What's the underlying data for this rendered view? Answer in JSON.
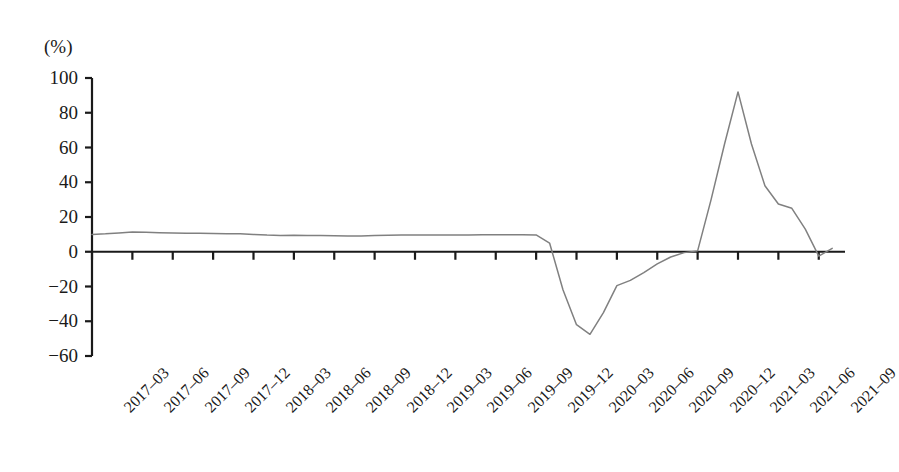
{
  "chart_data": {
    "type": "line",
    "title": "",
    "xlabel": "",
    "ylabel": "",
    "unit_label": "(%)",
    "ylim": [
      -60,
      100
    ],
    "ytick_values": [
      100,
      80,
      60,
      40,
      20,
      0,
      -20,
      -40,
      -60
    ],
    "ytick_labels": [
      "100",
      "80",
      "60",
      "40",
      "20",
      "0",
      "−20",
      "−40",
      "−60"
    ],
    "grid": false,
    "legend": "none",
    "zero_line": true,
    "categories": [
      "2017‒03",
      "2017‒06",
      "2017‒09",
      "2017‒12",
      "2018‒03",
      "2018‒06",
      "2018‒09",
      "2018‒12",
      "2019‒03",
      "2019‒06",
      "2019‒09",
      "2019‒12",
      "2020‒03",
      "2020‒06",
      "2020‒09",
      "2020‒12",
      "2021‒03",
      "2021‒06",
      "2021‒09"
    ],
    "series": [
      {
        "name": "series-1",
        "color": "#808080",
        "x": [
          "2017-03",
          "2017-04",
          "2017-05",
          "2017-06",
          "2017-07",
          "2017-08",
          "2017-09",
          "2017-10",
          "2017-11",
          "2017-12",
          "2018-01",
          "2018-02",
          "2018-03",
          "2018-04",
          "2018-05",
          "2018-06",
          "2018-07",
          "2018-08",
          "2018-09",
          "2018-10",
          "2018-11",
          "2018-12",
          "2019-01",
          "2019-02",
          "2019-03",
          "2019-04",
          "2019-05",
          "2019-06",
          "2019-07",
          "2019-08",
          "2019-09",
          "2019-10",
          "2019-11",
          "2019-12",
          "2020-01",
          "2020-02",
          "2020-03",
          "2020-04",
          "2020-05",
          "2020-06",
          "2020-07",
          "2020-08",
          "2020-09",
          "2020-10",
          "2020-11",
          "2020-12",
          "2021-01",
          "2021-02",
          "2021-03",
          "2021-04",
          "2021-05",
          "2021-06",
          "2021-07",
          "2021-08",
          "2021-09",
          "2021-10"
        ],
        "values": [
          10.0,
          10.3,
          10.8,
          11.3,
          11.2,
          11.0,
          10.8,
          10.7,
          10.6,
          10.5,
          10.4,
          10.3,
          10.0,
          9.6,
          9.4,
          9.5,
          9.4,
          9.3,
          9.2,
          9.1,
          9.0,
          9.4,
          9.5,
          9.6,
          9.6,
          9.6,
          9.7,
          9.7,
          9.7,
          9.8,
          9.8,
          9.8,
          9.8,
          9.7,
          5.0,
          -22.0,
          -42.0,
          -47.5,
          -35.0,
          -19.5,
          -16.5,
          -12.0,
          -7.0,
          -3.0,
          -0.5,
          0.5,
          30.0,
          62.0,
          92.0,
          62.0,
          38.0,
          27.5,
          25.0,
          13.0,
          -2.5,
          2.0
        ]
      }
    ]
  },
  "axes": {
    "y_axis_name": "y-axis",
    "x_axis_name": "x-axis"
  }
}
